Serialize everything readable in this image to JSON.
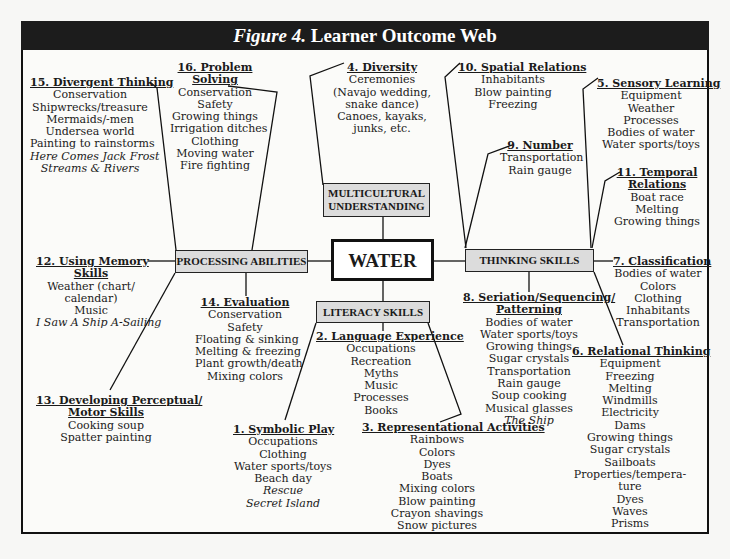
{
  "title": {
    "prefix": "Figure 4.",
    "text": " Learner Outcome Web"
  },
  "center": {
    "label": "WATER"
  },
  "hubs": {
    "multicultural": {
      "line1": "MULTICULTURAL",
      "line2": "UNDERSTANDING"
    },
    "processing": {
      "label": "PROCESSING ABILITIES"
    },
    "thinking": {
      "label": "THINKING SKILLS"
    },
    "literacy": {
      "label": "LITERACY SKILLS"
    }
  },
  "outcomes": {
    "symbolic_play": {
      "heading": "1. Symbolic Play",
      "items": [
        "Occupations",
        "Clothing",
        "Water sports/toys",
        "Beach day"
      ],
      "titles": [
        "Rescue",
        "Secret Island"
      ]
    },
    "language_experience": {
      "heading": "2. Language Experience",
      "items": [
        "Occupations",
        "Recreation",
        "Myths",
        "Music",
        "Processes",
        "Books"
      ]
    },
    "representational": {
      "heading": "3. Representational Activities",
      "items": [
        "Rainbows",
        "Colors",
        "Dyes",
        "Boats",
        "Mixing colors",
        "Blow painting",
        "Crayon shavings",
        "Snow pictures"
      ]
    },
    "diversity": {
      "heading": "4. Diversity",
      "items": [
        "Ceremonies",
        "(Navajo wedding,",
        "snake dance)",
        "Canoes, kayaks,",
        "junks, etc."
      ]
    },
    "sensory": {
      "heading": "5. Sensory Learning",
      "items": [
        "Equipment",
        "Weather",
        "Processes",
        "Bodies of water",
        "Water sports/toys"
      ]
    },
    "relational": {
      "heading": "6. Relational Thinking",
      "items": [
        "Equipment",
        "Freezing",
        "Melting",
        "Windmills",
        "Electricity",
        "Dams",
        "Growing things",
        "Sugar crystals",
        "Sailboats",
        "Properties/tempera-",
        "ture",
        "Dyes",
        "Waves",
        "Prisms"
      ]
    },
    "classification": {
      "heading": "7. Classification",
      "items": [
        "Bodies of water",
        "Colors",
        "Clothing",
        "Inhabitants",
        "Transportation"
      ]
    },
    "seriation": {
      "heading1": "8. Seriation/Sequencing/",
      "heading2": "Patterning",
      "items": [
        "Bodies of water",
        "Water sports/toys",
        "Growing things",
        "Sugar crystals",
        "Transportation",
        "Rain gauge",
        "Soup cooking",
        "Musical glasses"
      ],
      "titles": [
        "The Ship"
      ]
    },
    "number": {
      "heading": "9. Number",
      "items": [
        "Transportation",
        "Rain gauge"
      ]
    },
    "spatial": {
      "heading": "10. Spatial Relations",
      "items": [
        "Inhabitants",
        "Blow painting",
        "Freezing"
      ]
    },
    "temporal": {
      "heading1": "11. Temporal",
      "heading2": "Relations",
      "items": [
        "Boat race",
        "Melting",
        "Growing things"
      ]
    },
    "memory": {
      "heading1": "12. Using Memory",
      "heading2": "Skills",
      "items": [
        "Weather (chart/",
        "calendar)",
        "Music"
      ],
      "titles": [
        "I Saw A Ship A-Sailing"
      ]
    },
    "perceptual": {
      "heading1": "13. Developing Perceptual/",
      "heading2": "Motor Skills",
      "items": [
        "Cooking soup",
        "Spatter painting"
      ]
    },
    "evaluation": {
      "heading": "14. Evaluation",
      "items": [
        "Conservation",
        "Safety",
        "Floating & sinking",
        "Melting & freezing",
        "Plant growth/death",
        "Mixing colors"
      ]
    },
    "divergent": {
      "heading": "15. Divergent Thinking",
      "items": [
        "Conservation",
        "Shipwrecks/treasure",
        "Mermaids/-men",
        "Undersea world",
        "Painting to rainstorms"
      ],
      "titles": [
        "Here Comes Jack Frost",
        "Streams & Rivers"
      ]
    },
    "problem_solving": {
      "heading1": "16. Problem",
      "heading2": "Solving",
      "items": [
        "Conservation",
        "Safety",
        "Growing things",
        "Irrigation ditches",
        "Clothing",
        "Moving water",
        "Fire fighting"
      ]
    }
  },
  "colors": {
    "title_bg": "#1c1c1c",
    "hub_fill": "#dcdcdc",
    "line": "#111111",
    "page": "#fbfbf9"
  }
}
